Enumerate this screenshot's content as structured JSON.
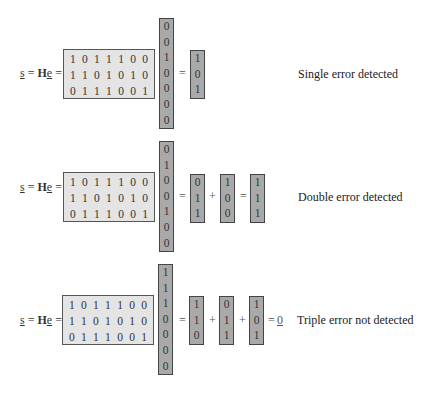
{
  "equations": [
    {
      "lhs": {
        "s": "s",
        "eq1": " = ",
        "H": "H",
        "e": "e",
        "eq2": " ="
      },
      "H_matrix": [
        [
          1,
          0,
          1,
          1,
          1,
          0,
          0
        ],
        [
          1,
          1,
          0,
          1,
          0,
          1,
          0
        ],
        [
          0,
          1,
          1,
          1,
          0,
          0,
          1
        ]
      ],
      "error_vector": [
        0,
        0,
        1,
        0,
        0,
        0,
        0
      ],
      "terms": [
        [
          1,
          0,
          1
        ]
      ],
      "result": null,
      "label": "Single error detected"
    },
    {
      "lhs": {
        "s": "s",
        "eq1": " = ",
        "H": "H",
        "e": "e",
        "eq2": " ="
      },
      "H_matrix": [
        [
          1,
          0,
          1,
          1,
          1,
          0,
          0
        ],
        [
          1,
          1,
          0,
          1,
          0,
          1,
          0
        ],
        [
          0,
          1,
          1,
          1,
          0,
          0,
          1
        ]
      ],
      "error_vector": [
        0,
        1,
        0,
        0,
        1,
        0,
        0
      ],
      "terms": [
        [
          0,
          1,
          1
        ],
        [
          1,
          0,
          0
        ]
      ],
      "result": [
        1,
        1,
        1
      ],
      "label": "Double error detected"
    },
    {
      "lhs": {
        "s": "s",
        "eq1": " = ",
        "H": "H",
        "e": "e",
        "eq2": " ="
      },
      "H_matrix": [
        [
          1,
          0,
          1,
          1,
          1,
          0,
          0
        ],
        [
          1,
          1,
          0,
          1,
          0,
          1,
          0
        ],
        [
          0,
          1,
          1,
          1,
          0,
          0,
          1
        ]
      ],
      "error_vector": [
        1,
        1,
        1,
        0,
        0,
        0,
        0
      ],
      "terms": [
        [
          1,
          1,
          0
        ],
        [
          0,
          1,
          1
        ],
        [
          1,
          0,
          1
        ]
      ],
      "result_zero": "0",
      "label": "Triple error not detected"
    }
  ],
  "operators": {
    "equals": "=",
    "plus": "+"
  },
  "colors": {
    "matrix_fill": "#e4e4e4",
    "vector_fill": "#a9a9a9",
    "border": "#444444"
  }
}
